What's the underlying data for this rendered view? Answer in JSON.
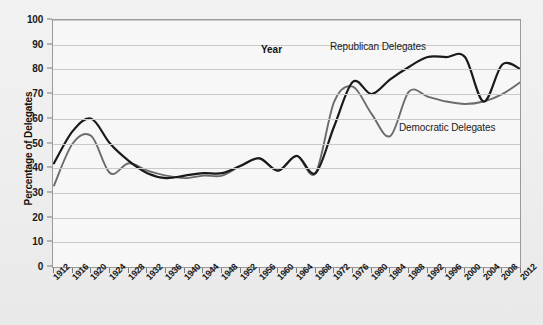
{
  "chart_data": {
    "type": "line",
    "title": "",
    "xlabel": "Year",
    "ylabel": "Percentage of Delegates",
    "xlim": [
      1912,
      2012
    ],
    "ylim": [
      0,
      100
    ],
    "ytick_step": 10,
    "grid": true,
    "legend_position": "inline-annotations",
    "categories": [
      1912,
      1916,
      1920,
      1924,
      1928,
      1932,
      1936,
      1940,
      1944,
      1948,
      1952,
      1956,
      1960,
      1964,
      1968,
      1972,
      1976,
      1980,
      1984,
      1988,
      1992,
      1996,
      2000,
      2004,
      2008,
      2012
    ],
    "yticks": [
      0,
      10,
      20,
      30,
      40,
      50,
      60,
      70,
      80,
      90,
      100
    ],
    "xticks": [
      "1912",
      "1916",
      "1920",
      "1924",
      "1928",
      "1932",
      "1936",
      "1940",
      "1944",
      "1948",
      "1952",
      "1956",
      "1960",
      "1964",
      "1968",
      "1972",
      "1976",
      "1980",
      "1984",
      "1988",
      "1992",
      "1996",
      "2000",
      "2004",
      "2008",
      "2012"
    ],
    "series": [
      {
        "name": "Republican Delegates",
        "color": "#1a1a1a",
        "values": [
          42,
          55,
          60,
          50,
          43,
          38,
          36,
          37,
          38,
          38,
          41,
          44,
          39,
          45,
          38,
          57,
          75,
          70,
          76,
          81,
          85,
          85,
          85,
          67,
          82,
          80
        ]
      },
      {
        "name": "Democratic Delegates",
        "color": "#6b6b6b",
        "values": [
          33,
          50,
          53,
          38,
          42,
          39,
          37,
          36,
          37,
          37,
          41,
          44,
          39,
          45,
          38,
          67,
          73,
          62,
          53,
          71,
          69,
          67,
          66,
          67,
          70,
          75
        ]
      }
    ],
    "annotations": [
      {
        "text": "Republican Delegates",
        "x": 330,
        "y": 41
      },
      {
        "text": "Democratic Delegates",
        "x": 399,
        "y": 122
      }
    ]
  },
  "axis": {
    "x_title": "Year",
    "y_title": "Percentage of Delegates"
  }
}
